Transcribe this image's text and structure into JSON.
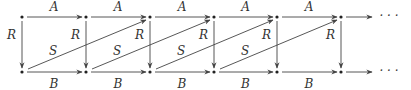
{
  "diagram": {
    "colors": {
      "line": "#444444",
      "text": "#333333",
      "background": "#ffffff"
    },
    "top_row_y": 17,
    "bottom_row_y": 72,
    "node_x": [
      22,
      86,
      150,
      214,
      277,
      341
    ],
    "labels": {
      "horizontal_top": "A",
      "horizontal_bottom": "B",
      "vertical": "R",
      "diagonal": "S",
      "continuation": "· · ·"
    },
    "top_edges": [
      {
        "from": 0,
        "to": 1,
        "label": "A"
      },
      {
        "from": 1,
        "to": 2,
        "label": "A"
      },
      {
        "from": 2,
        "to": 3,
        "label": "A"
      },
      {
        "from": 3,
        "to": 4,
        "label": "A"
      },
      {
        "from": 4,
        "to": 5,
        "label": "A"
      }
    ],
    "bottom_edges": [
      {
        "from": 0,
        "to": 1,
        "label": "B"
      },
      {
        "from": 1,
        "to": 2,
        "label": "B"
      },
      {
        "from": 2,
        "to": 3,
        "label": "B"
      },
      {
        "from": 3,
        "to": 4,
        "label": "B"
      },
      {
        "from": 4,
        "to": 5,
        "label": "B"
      }
    ],
    "vertical_edges": [
      {
        "node": 0,
        "label": "R"
      },
      {
        "node": 1,
        "label": "R"
      },
      {
        "node": 2,
        "label": "R"
      },
      {
        "node": 3,
        "label": "R"
      },
      {
        "node": 4,
        "label": "R"
      },
      {
        "node": 5,
        "label": "R"
      }
    ],
    "diagonal_edges": [
      {
        "from_bottom": 0,
        "to_top": 2,
        "label": "S"
      },
      {
        "from_bottom": 1,
        "to_top": 3,
        "label": "S"
      },
      {
        "from_bottom": 2,
        "to_top": 4,
        "label": "S"
      },
      {
        "from_bottom": 3,
        "to_top": 5,
        "label": "S"
      }
    ],
    "continuation_top": "· · ·",
    "continuation_bottom": "· · ·"
  }
}
